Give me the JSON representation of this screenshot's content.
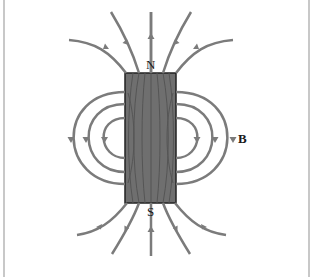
{
  "diagram": {
    "labels": {
      "north": "N",
      "south": "S",
      "field": "B"
    },
    "colors": {
      "field_line": "#7b7b7b",
      "magnet_fill": "#6f6f6f",
      "magnet_edge": "#222222",
      "background": "#ffffff",
      "frame": "#c8c8c8"
    }
  }
}
